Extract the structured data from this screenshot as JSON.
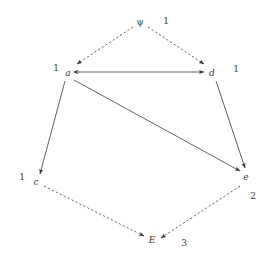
{
  "diagram": {
    "type": "directed-graph",
    "width": 274,
    "height": 265,
    "background_color": "#ffffff",
    "stroke_color": "#3a3a3a",
    "nodes": [
      {
        "id": "psi",
        "label": "ψ",
        "x": 140,
        "y": 22,
        "style": "greek"
      },
      {
        "id": "a",
        "label": "a",
        "x": 68,
        "y": 73,
        "style": "italic"
      },
      {
        "id": "d",
        "label": "d",
        "x": 212,
        "y": 73,
        "style": "italic"
      },
      {
        "id": "c",
        "label": "c",
        "x": 36,
        "y": 182,
        "style": "italic"
      },
      {
        "id": "e",
        "label": "e",
        "x": 246,
        "y": 177,
        "style": "italic"
      },
      {
        "id": "E",
        "label": "E",
        "x": 152,
        "y": 240,
        "style": "italic"
      }
    ],
    "edges": [
      {
        "id": "psi-a",
        "from": "psi",
        "to": "a",
        "line": "dashed",
        "heads": "one"
      },
      {
        "id": "psi-d",
        "from": "psi",
        "to": "d",
        "line": "dashed",
        "heads": "one"
      },
      {
        "id": "a-d",
        "from": "a",
        "to": "d",
        "line": "solid",
        "heads": "both"
      },
      {
        "id": "a-c",
        "from": "a",
        "to": "c",
        "line": "solid",
        "heads": "one"
      },
      {
        "id": "a-e",
        "from": "a",
        "to": "e",
        "line": "solid",
        "heads": "one"
      },
      {
        "id": "d-e",
        "from": "d",
        "to": "e",
        "line": "solid",
        "heads": "one"
      },
      {
        "id": "c-E",
        "from": "c",
        "to": "E",
        "line": "dashed",
        "heads": "one"
      },
      {
        "id": "e-E",
        "from": "e",
        "to": "E",
        "line": "dashed",
        "heads": "one"
      }
    ],
    "weights": [
      {
        "id": "w-psi",
        "value": "1",
        "x": 166,
        "y": 21,
        "near": "psi"
      },
      {
        "id": "w-a",
        "value": "1",
        "x": 56,
        "y": 68,
        "near": "a"
      },
      {
        "id": "w-d",
        "value": "1",
        "x": 236,
        "y": 69,
        "near": "d"
      },
      {
        "id": "w-c",
        "value": "1",
        "x": 22,
        "y": 177,
        "near": "c"
      },
      {
        "id": "w-e",
        "value": "2",
        "x": 253,
        "y": 196,
        "near": "e"
      },
      {
        "id": "w-E",
        "value": "3",
        "x": 184,
        "y": 243,
        "near": "E"
      }
    ]
  }
}
